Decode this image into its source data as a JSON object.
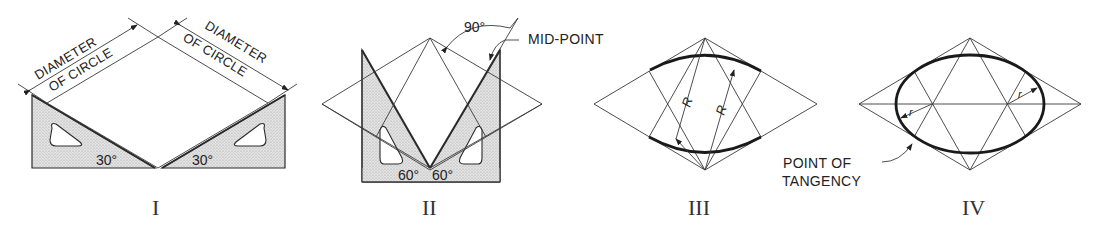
{
  "figure": {
    "type": "technical drawing - approximate ellipse (four-center method) in isometric rhombus",
    "colors": {
      "line": "#3a3a3a",
      "heavy": "#1a1a1a",
      "shade": "#d8d8d8",
      "background": "#ffffff"
    }
  },
  "panels": [
    {
      "numeral": "I",
      "labels": {
        "dim_left_1": "DIAMETER",
        "dim_left_2": "OF CIRCLE",
        "dim_right_1": "DIAMETER",
        "dim_right_2": "OF CIRCLE",
        "angle_left": "30°",
        "angle_right": "30°"
      }
    },
    {
      "numeral": "II",
      "labels": {
        "angle_top": "90°",
        "midpoint": "MID-POINT",
        "angle_left": "60°",
        "angle_right": "60°"
      }
    },
    {
      "numeral": "III",
      "labels": {
        "radius_left": "R",
        "radius_right": "R"
      }
    },
    {
      "numeral": "IV",
      "labels": {
        "radius_left": "r",
        "radius_right": "r",
        "tangency_1": "POINT OF",
        "tangency_2": "TANGENCY"
      }
    }
  ]
}
